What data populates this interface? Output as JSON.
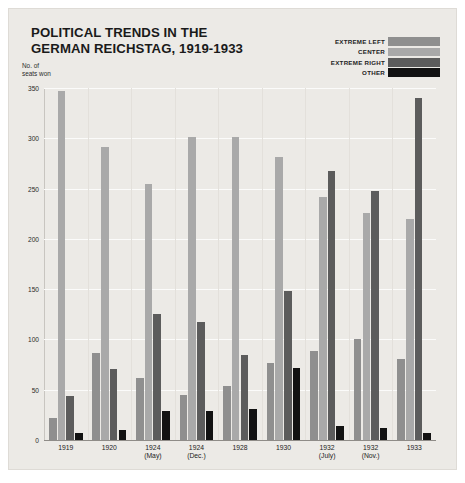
{
  "title": {
    "line1": "POLITICAL TRENDS IN THE",
    "line2": "GERMAN REICHSTAG, 1919-1933"
  },
  "axis_caption": {
    "line1": "No. of",
    "line2": "seats won"
  },
  "legend": {
    "entries": [
      {
        "label": "EXTREME LEFT",
        "color": "#8f8f8f"
      },
      {
        "label": "CENTER",
        "color": "#a9a9a9"
      },
      {
        "label": "EXTREME RIGHT",
        "color": "#5c5c5c"
      },
      {
        "label": "OTHER",
        "color": "#121212"
      }
    ]
  },
  "yticks": [
    "350",
    "300",
    "250",
    "200",
    "150",
    "100",
    "50",
    "0"
  ],
  "chart_data": {
    "type": "bar",
    "title": "POLITICAL TRENDS IN THE GERMAN REICHSTAG, 1919-1933",
    "xlabel": "",
    "ylabel": "No. of seats won",
    "ylim": [
      0,
      350
    ],
    "ytick_step": 50,
    "grid": true,
    "legend_position": "top-right",
    "categories": [
      {
        "line1": "1919",
        "line2": ""
      },
      {
        "line1": "1920",
        "line2": ""
      },
      {
        "line1": "1924",
        "line2": "(May)"
      },
      {
        "line1": "1924",
        "line2": "(Dec.)"
      },
      {
        "line1": "1928",
        "line2": ""
      },
      {
        "line1": "1930",
        "line2": ""
      },
      {
        "line1": "1932",
        "line2": "(July)"
      },
      {
        "line1": "1932",
        "line2": "(Nov.)"
      },
      {
        "line1": "1933",
        "line2": ""
      }
    ],
    "series": [
      {
        "name": "EXTREME LEFT",
        "color": "#8f8f8f",
        "values": [
          22,
          87,
          62,
          45,
          54,
          77,
          89,
          100,
          81
        ]
      },
      {
        "name": "CENTER",
        "color": "#a9a9a9",
        "values": [
          347,
          291,
          255,
          301,
          301,
          281,
          242,
          226,
          220
        ]
      },
      {
        "name": "EXTREME RIGHT",
        "color": "#5c5c5c",
        "values": [
          44,
          71,
          125,
          117,
          85,
          148,
          267,
          248,
          340
        ]
      },
      {
        "name": "OTHER",
        "color": "#121212",
        "values": [
          7,
          10,
          29,
          29,
          31,
          72,
          14,
          12,
          7
        ]
      }
    ]
  }
}
